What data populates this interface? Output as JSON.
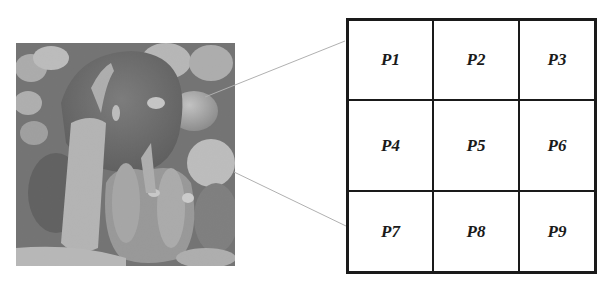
{
  "figure": {
    "image": {
      "description": "Grayscale photograph of peppers (bell peppers and chili pepper)",
      "icon": "peppers-photo"
    },
    "grid": {
      "rows": 3,
      "cols": 3,
      "cells": [
        "P1",
        "P2",
        "P3",
        "P4",
        "P5",
        "P6",
        "P7",
        "P8",
        "P9"
      ]
    },
    "connectors": [
      {
        "name": "top-connector",
        "from": [
          205,
          97
        ],
        "to": [
          345,
          41
        ]
      },
      {
        "name": "bottom-connector",
        "from": [
          234,
          172
        ],
        "to": [
          346,
          226
        ]
      }
    ],
    "colors": {
      "grid_line": "#1a1a1a",
      "connector": "#b0b0b0",
      "background": "#ffffff"
    }
  }
}
